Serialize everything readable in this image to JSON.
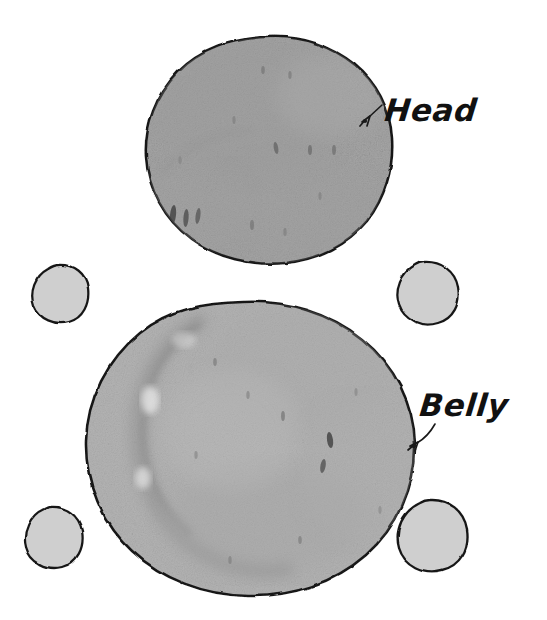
{
  "figure": {
    "medium": "pencil-and-ink-drawing",
    "background_color": "#ffffff",
    "outline_color": "#1a1a1a",
    "shapes": [
      {
        "id": "head-mass",
        "name": "head",
        "role": "large-upper-round-mass",
        "fill_color": "#a6a6a6",
        "center": [
          266,
          150
        ],
        "radius": [
          118,
          113
        ]
      },
      {
        "id": "belly-mass",
        "name": "belly",
        "role": "large-lower-round-mass",
        "fill_color": "#b4b4b4",
        "center": [
          243,
          441
        ],
        "radius": [
          143,
          139
        ]
      },
      {
        "id": "blob-top-left",
        "name": "small-blob",
        "role": "small-round-mass",
        "fill_color": "#d4d4d4",
        "center": [
          59,
          294
        ],
        "radius": [
          29,
          28
        ]
      },
      {
        "id": "blob-top-right",
        "name": "small-blob",
        "role": "small-round-mass",
        "fill_color": "#d4d4d4",
        "center": [
          427,
          292
        ],
        "radius": [
          31,
          29
        ]
      },
      {
        "id": "blob-bottom-left",
        "name": "small-blob",
        "role": "small-round-mass",
        "fill_color": "#d4d4d4",
        "center": [
          53,
          537
        ],
        "radius": [
          30,
          29
        ]
      },
      {
        "id": "blob-bottom-right",
        "name": "small-blob",
        "role": "small-round-mass",
        "fill_color": "#d4d4d4",
        "center": [
          432,
          534
        ],
        "radius": [
          35,
          33
        ]
      }
    ]
  },
  "annotations": [
    {
      "id": "head",
      "label": "Head",
      "text_color": "#111111",
      "pointer": "leader-arrow",
      "pointer_direction": "down-left",
      "points_to": "head-mass"
    },
    {
      "id": "belly",
      "label": "Belly",
      "text_color": "#111111",
      "pointer": "curved-leader-arrow",
      "pointer_direction": "down-left",
      "points_to": "belly-mass"
    }
  ]
}
